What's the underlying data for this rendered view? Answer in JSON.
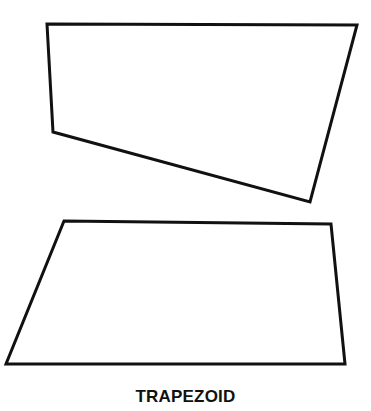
{
  "caption": "TRAPEZOID",
  "colors": {
    "stroke": "#111111",
    "background": "#ffffff"
  },
  "shapes": [
    {
      "name": "trapezoid-upper",
      "points": [
        [
          47,
          24
        ],
        [
          357,
          25
        ],
        [
          310,
          202
        ],
        [
          53,
          132
        ]
      ]
    },
    {
      "name": "trapezoid-lower",
      "points": [
        [
          64,
          221
        ],
        [
          331,
          224
        ],
        [
          345,
          364
        ],
        [
          6,
          364
        ]
      ]
    }
  ]
}
